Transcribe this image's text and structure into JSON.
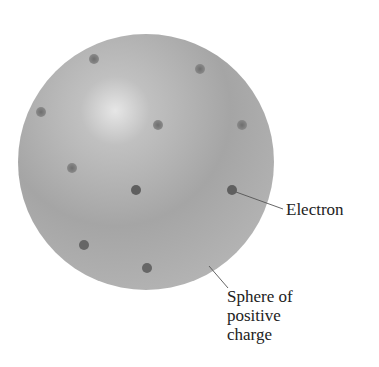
{
  "diagram": {
    "sphere": {
      "cx": 146,
      "cy": 162,
      "r": 128,
      "color": "#a8a8a8",
      "highlight": "#e2e2e2"
    },
    "electrons": [
      {
        "x": 94,
        "y": 59
      },
      {
        "x": 200,
        "y": 69
      },
      {
        "x": 41,
        "y": 112
      },
      {
        "x": 158,
        "y": 125
      },
      {
        "x": 242,
        "y": 125
      },
      {
        "x": 72,
        "y": 168
      },
      {
        "x": 136,
        "y": 190
      },
      {
        "x": 232,
        "y": 190
      },
      {
        "x": 84,
        "y": 245
      },
      {
        "x": 147,
        "y": 268
      }
    ],
    "labels": {
      "electron": "Electron",
      "sphere_line1": "Sphere of",
      "sphere_line2": "positive",
      "sphere_line3": "charge"
    }
  }
}
